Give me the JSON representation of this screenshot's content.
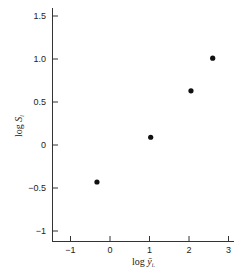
{
  "chart_data": {
    "type": "scatter",
    "title": "",
    "xlabel": "log ȳi.",
    "ylabel": "log Si",
    "xlim": [
      -1.45,
      3.1
    ],
    "ylim": [
      -1.12,
      1.55
    ],
    "xticks": [
      -1,
      0,
      1,
      2,
      3
    ],
    "xtick_labels": [
      "−1",
      "0",
      "1",
      "2",
      "3"
    ],
    "yticks": [
      1.5,
      1.0,
      0.5,
      0,
      -0.5,
      -1
    ],
    "ytick_labels": [
      "1.5",
      "1.0",
      "0.5",
      "0",
      "−0.5",
      "−1"
    ],
    "grid": false,
    "legend": null,
    "points": [
      {
        "x": -0.33,
        "y": -0.43
      },
      {
        "x": 1.03,
        "y": 0.09
      },
      {
        "x": 2.05,
        "y": 0.63
      },
      {
        "x": 2.6,
        "y": 1.01
      }
    ],
    "marker_color": "#111111"
  }
}
